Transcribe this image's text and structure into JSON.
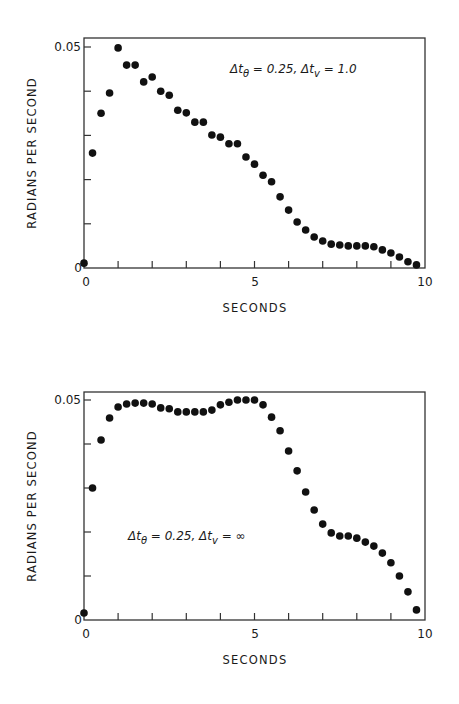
{
  "chart_data": [
    {
      "type": "scatter",
      "title": "",
      "annotation": "Δtθ = 0.25,  Δtv = 1.0",
      "annotation_parts": {
        "a": "Δt",
        "a_sub": "θ",
        "b": " = 0.25,  Δt",
        "b_sub": "v",
        "c": " = 1.0"
      },
      "xlabel": "SECONDS",
      "ylabel": "RADIANS PER SECOND",
      "xlim": [
        0,
        10
      ],
      "ylim": [
        0,
        0.05
      ],
      "x_tick_labels": [
        "0",
        "5",
        "10"
      ],
      "y_tick_labels": [
        "0",
        "0.05"
      ],
      "x_minor_ticks": [
        1,
        2,
        3,
        4,
        5,
        6,
        7,
        8,
        9
      ],
      "y_minor_ticks": [
        0.01,
        0.02,
        0.03,
        0.04
      ],
      "grid": false,
      "marker": "filled-circle",
      "x": [
        0,
        0.25,
        0.5,
        0.75,
        1.0,
        1.25,
        1.5,
        1.75,
        2.0,
        2.25,
        2.5,
        2.75,
        3.0,
        3.25,
        3.5,
        3.75,
        4.0,
        4.25,
        4.5,
        4.75,
        5.0,
        5.25,
        5.5,
        5.75,
        6.0,
        6.25,
        6.5,
        6.75,
        7.0,
        7.25,
        7.5,
        7.75,
        8.0,
        8.25,
        8.5,
        8.75,
        9.0,
        9.25,
        9.5,
        9.75
      ],
      "values": [
        0.0011,
        0.026,
        0.035,
        0.0396,
        0.0498,
        0.0459,
        0.0459,
        0.0421,
        0.0432,
        0.04,
        0.0391,
        0.0357,
        0.0351,
        0.033,
        0.033,
        0.0301,
        0.0296,
        0.0281,
        0.0281,
        0.0251,
        0.0235,
        0.021,
        0.0195,
        0.0161,
        0.0131,
        0.0104,
        0.0086,
        0.007,
        0.0061,
        0.0054,
        0.0052,
        0.005,
        0.005,
        0.005,
        0.0048,
        0.0041,
        0.0034,
        0.0025,
        0.0014,
        0.0007
      ]
    },
    {
      "type": "scatter",
      "title": "",
      "annotation": "Δtθ = 0.25,  Δtv = ∞",
      "annotation_parts": {
        "a": "Δt",
        "a_sub": "θ",
        "b": " = 0.25,  Δt",
        "b_sub": "v",
        "c": " =  ∞"
      },
      "xlabel": "SECONDS",
      "ylabel": "RADIANS PER SECOND",
      "xlim": [
        0,
        10
      ],
      "ylim": [
        0,
        0.05
      ],
      "x_tick_labels": [
        "0",
        "5",
        "10"
      ],
      "y_tick_labels": [
        "0",
        "0.05"
      ],
      "x_minor_ticks": [
        1,
        2,
        3,
        4,
        5,
        6,
        7,
        8,
        9
      ],
      "y_minor_ticks": [
        0.01,
        0.02,
        0.03,
        0.04
      ],
      "grid": false,
      "marker": "filled-circle",
      "x": [
        0,
        0.25,
        0.5,
        0.75,
        1.0,
        1.25,
        1.5,
        1.75,
        2.0,
        2.25,
        2.5,
        2.75,
        3.0,
        3.25,
        3.5,
        3.75,
        4.0,
        4.25,
        4.5,
        4.75,
        5.0,
        5.25,
        5.5,
        5.75,
        6.0,
        6.25,
        6.5,
        6.75,
        7.0,
        7.25,
        7.5,
        7.75,
        8.0,
        8.25,
        8.5,
        8.75,
        9.0,
        9.25,
        9.5,
        9.75
      ],
      "values": [
        0.0016,
        0.03,
        0.0409,
        0.0459,
        0.0484,
        0.0491,
        0.0493,
        0.0493,
        0.0491,
        0.0482,
        0.048,
        0.0473,
        0.0473,
        0.0473,
        0.0473,
        0.0477,
        0.0489,
        0.0495,
        0.05,
        0.05,
        0.05,
        0.0489,
        0.0461,
        0.043,
        0.0384,
        0.0339,
        0.0291,
        0.025,
        0.0218,
        0.0198,
        0.0191,
        0.0191,
        0.0186,
        0.0177,
        0.0168,
        0.0152,
        0.013,
        0.01,
        0.0064,
        0.0023
      ]
    }
  ],
  "colors": {
    "ink": "#111111",
    "frame": "#333333",
    "background": "#ffffff"
  }
}
